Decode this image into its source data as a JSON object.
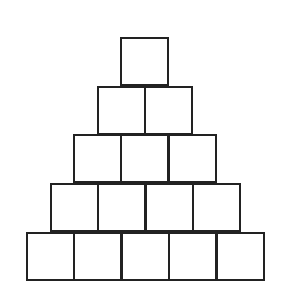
{
  "diagram": {
    "type": "block-pyramid",
    "rows": [
      1,
      2,
      3,
      4,
      5
    ],
    "cell_size": 49,
    "pitch": 47.4,
    "row_tops": [
      37,
      86,
      134,
      183,
      232
    ],
    "row_lefts": [
      120,
      97,
      73,
      50,
      26
    ],
    "line_color": "#222222",
    "fill_color": "#ffffff"
  }
}
